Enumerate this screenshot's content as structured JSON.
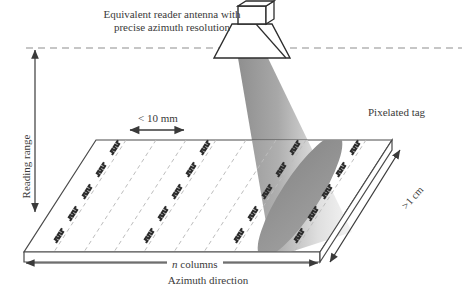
{
  "figure": {
    "domain": "technical-diagram",
    "antenna_title_line1": "Equivalent reader antenna with",
    "antenna_title_line2": "precise azimuth resolution",
    "reading_range_label": "Reading range",
    "column_width_label": "< 10 mm",
    "pixelated_tag_label": "Pixelated tag",
    "depth_label": ">1 cm",
    "n_columns_label_prefix": "n",
    "n_columns_label_suffix": " columns",
    "azimuth_label": "Azimuth direction",
    "caption": ""
  },
  "icons": {
    "antenna": "horn-antenna-icon",
    "beam": "radiation-beam-icon",
    "footprint": "beam-footprint-ellipse-icon",
    "tag_element": "meander-tag-element-icon"
  },
  "colors": {
    "ink": "#2b2b2b",
    "line": "#3a3a3a",
    "dashed_grid": "#b9b9b9",
    "beam_dark": "#9a9a9a",
    "beam_light": "#f2f2f2",
    "footprint": "#8c8c8c",
    "slab_face": "#ffffff",
    "slab_edge": "#4a4a4a"
  },
  "geometry": {
    "slab_top_left_x": 96,
    "slab_top_y": 140,
    "slab_bottom_left_x": 24,
    "slab_bottom_y": 252,
    "slab_right_x": 392,
    "slab_thickness": 10,
    "antenna_center_x": 252,
    "antenna_aperture_y": 58,
    "dashed_line_y": 48,
    "n_dashed_columns": 9,
    "tag_rows": 5
  }
}
